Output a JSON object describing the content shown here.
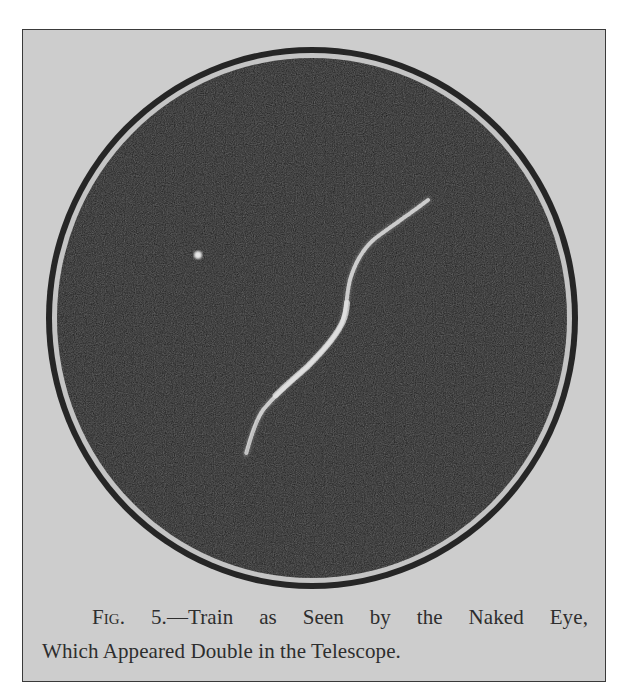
{
  "figure": {
    "label": "Fig. 5.",
    "caption_line1_rest": "—Train as Seen by the Naked Eye,",
    "caption_line2": "Which Appeared Double in the Telescope.",
    "full_caption": "Fig. 5.—Train as Seen by the Naked Eye, Which Appeared Double in the Telescope.",
    "colors": {
      "page_background": "#ffffff",
      "plate_fill": "#cdcdcd",
      "sky": "#1f1f1f",
      "outer_ring": "#262626",
      "inner_ring": "#c4c4c4",
      "train": "#d8d8d8",
      "star": "#e6e6e6",
      "caption_text": "#2e2e2e"
    },
    "field_of_view": {
      "cx": 312,
      "cy": 318,
      "rx": 266,
      "ry": 271
    },
    "star": {
      "x": 198,
      "y": 255,
      "r": 4
    },
    "train_path_points": [
      [
        428,
        200
      ],
      [
        403,
        220
      ],
      [
        377,
        237
      ],
      [
        360,
        257
      ],
      [
        350,
        280
      ],
      [
        347,
        303
      ],
      [
        340,
        327
      ],
      [
        327,
        347
      ],
      [
        307,
        367
      ],
      [
        283,
        387
      ],
      [
        263,
        410
      ],
      [
        250,
        440
      ],
      [
        246,
        454
      ]
    ]
  }
}
